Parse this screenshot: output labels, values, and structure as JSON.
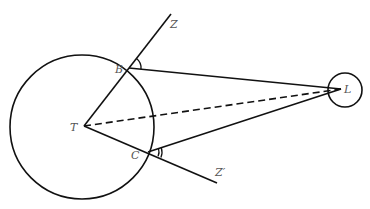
{
  "diagram": {
    "type": "geometry",
    "labels": {
      "T": "T",
      "B": "B",
      "C": "C",
      "L": "L",
      "Z": "Z",
      "Zprime": "Z′"
    },
    "shapes": {
      "earth_circle": {
        "cx": 82,
        "cy": 127,
        "r": 72
      },
      "moon_circle": {
        "cx": 345,
        "cy": 90,
        "r": 17
      }
    },
    "points": {
      "T": [
        84,
        126
      ],
      "B": [
        129,
        68
      ],
      "C": [
        148,
        152
      ],
      "L": [
        341,
        89
      ],
      "Z": [
        171,
        14
      ],
      "Zprime": [
        217,
        183
      ]
    },
    "lines": [
      {
        "from": "T",
        "to": "Z",
        "style": "solid"
      },
      {
        "from": "T",
        "to": "Zprime",
        "style": "solid"
      },
      {
        "from": "B",
        "to": "L",
        "style": "solid"
      },
      {
        "from": "C",
        "to": "L",
        "style": "solid"
      },
      {
        "from": "T",
        "to": "L",
        "style": "dashed"
      }
    ],
    "angle_marks": [
      {
        "at": "B",
        "between": [
          "Z",
          "L"
        ],
        "arcs": 1
      },
      {
        "at": "C",
        "between": [
          "L",
          "Zprime"
        ],
        "arcs": 2
      }
    ],
    "colors": {
      "line": "#111111",
      "label": "#555555",
      "background": "#ffffff"
    }
  }
}
